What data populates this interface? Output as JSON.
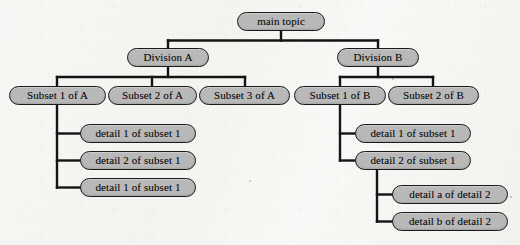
{
  "diagram": {
    "title": "main topic",
    "type": "hierarchical-tree",
    "background_color": "#f5f5f2",
    "node_fill_color": "#b9b9b9",
    "node_border_color": "#1a1a1a",
    "connector_color": "#141414",
    "nodes": [
      {
        "id": "root",
        "label": "main topic",
        "x": 237,
        "y": 12,
        "w": 88,
        "h": 19,
        "level": 0
      },
      {
        "id": "divA",
        "label": "Division A",
        "x": 127,
        "y": 48,
        "w": 82,
        "h": 19,
        "level": 1
      },
      {
        "id": "divB",
        "label": "Division B",
        "x": 337,
        "y": 48,
        "w": 82,
        "h": 19,
        "level": 1
      },
      {
        "id": "subA1",
        "label": "Subset 1 of A",
        "x": 9,
        "y": 86,
        "w": 97,
        "h": 19,
        "level": 2
      },
      {
        "id": "subA2",
        "label": "Subset 2 of A",
        "x": 108,
        "y": 86,
        "w": 89,
        "h": 19,
        "level": 2
      },
      {
        "id": "subA3",
        "label": "Subset 3 of A",
        "x": 199,
        "y": 86,
        "w": 91,
        "h": 19,
        "level": 2
      },
      {
        "id": "subB1",
        "label": "Subset 1 of B",
        "x": 294,
        "y": 86,
        "w": 92,
        "h": 19,
        "level": 2
      },
      {
        "id": "subB2",
        "label": "Subset 2 of B",
        "x": 388,
        "y": 86,
        "w": 91,
        "h": 19,
        "level": 2
      },
      {
        "id": "detA1",
        "label": "detail 1 of subset 1",
        "x": 80,
        "y": 124,
        "w": 116,
        "h": 19,
        "level": 3
      },
      {
        "id": "detA2",
        "label": "detail 2 of subset 1",
        "x": 80,
        "y": 151,
        "w": 116,
        "h": 19,
        "level": 3
      },
      {
        "id": "detA3",
        "label": "detail 1 of subset 1",
        "x": 80,
        "y": 178,
        "w": 116,
        "h": 19,
        "level": 3
      },
      {
        "id": "detB1",
        "label": "detail 1 of subset 1",
        "x": 355,
        "y": 124,
        "w": 116,
        "h": 19,
        "level": 3
      },
      {
        "id": "detB2",
        "label": "detail 2 of subset 1",
        "x": 355,
        "y": 151,
        "w": 116,
        "h": 19,
        "level": 3
      },
      {
        "id": "detB2a",
        "label": "detail a of detail 2",
        "x": 392,
        "y": 185,
        "w": 116,
        "h": 19,
        "level": 4
      },
      {
        "id": "detB2b",
        "label": "detail b of detail 2",
        "x": 392,
        "y": 212,
        "w": 116,
        "h": 19,
        "level": 4
      }
    ],
    "edges": [
      {
        "from": "root",
        "to": "divA",
        "style": "orthogonal"
      },
      {
        "from": "root",
        "to": "divB",
        "style": "orthogonal"
      },
      {
        "from": "divA",
        "to": "subA1",
        "style": "orthogonal"
      },
      {
        "from": "divA",
        "to": "subA2",
        "style": "orthogonal"
      },
      {
        "from": "divA",
        "to": "subA3",
        "style": "orthogonal"
      },
      {
        "from": "divB",
        "to": "subB1",
        "style": "orthogonal"
      },
      {
        "from": "divB",
        "to": "subB2",
        "style": "orthogonal"
      },
      {
        "from": "subA1",
        "to": "detA1",
        "style": "elbow"
      },
      {
        "from": "subA1",
        "to": "detA2",
        "style": "elbow"
      },
      {
        "from": "subA1",
        "to": "detA3",
        "style": "elbow"
      },
      {
        "from": "subB1",
        "to": "detB1",
        "style": "elbow"
      },
      {
        "from": "subB1",
        "to": "detB2",
        "style": "elbow"
      },
      {
        "from": "detB2",
        "to": "detB2a",
        "style": "elbow"
      },
      {
        "from": "detB2",
        "to": "detB2b",
        "style": "elbow"
      }
    ]
  }
}
